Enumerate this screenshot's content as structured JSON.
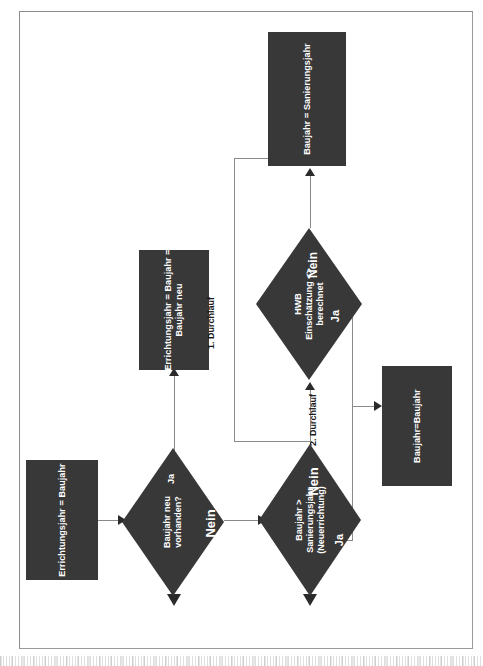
{
  "diagram": {
    "colors": {
      "node_fill": "#383838",
      "node_text": "#ffffff",
      "connector": "#8a8a8a",
      "arrowhead": "#2b2b2b",
      "frame_border": "#9a9a9a",
      "background": "#ffffff"
    },
    "nodes": [
      {
        "id": "start",
        "type": "process",
        "label": "Errichtungsjahr = Baujahr"
      },
      {
        "id": "decision-baujahr-neu",
        "type": "decision",
        "label": "Baujahr neu\nvorhanden?",
        "line1": "Baujahr neu",
        "line2": "vorhanden?",
        "branch_yes": "Ja",
        "branch_no": "Nein"
      },
      {
        "id": "process-errichtungsjahr-neu",
        "type": "process",
        "line1": "Errichtungsjahr = Baujahr =",
        "line2": "Baujahr neu"
      },
      {
        "id": "decision-sanierungsjahr",
        "type": "decision",
        "line1": "Baujahr >",
        "line2": "Sanierungsjahr",
        "line3": "(Neuerrichtung)",
        "branch_yes": "Ja",
        "branch_no": "Nein"
      },
      {
        "id": "decision-hwb",
        "type": "decision",
        "line1": "HWB",
        "line2": "Einschätzung <>",
        "line3": "berechnet",
        "branch_yes": "Ja",
        "branch_no": "Nein"
      },
      {
        "id": "result-baujahr-sanierungsjahr",
        "type": "process",
        "label": "Baujahr = Sanierungsjahr"
      },
      {
        "id": "result-baujahr-baujahr",
        "type": "process",
        "label": "Baujahr=Baujahr"
      }
    ],
    "flow_labels": [
      {
        "id": "pass-1",
        "text": "1. Durchlauf"
      },
      {
        "id": "pass-2",
        "text": "2. Durchlauf"
      }
    ]
  }
}
